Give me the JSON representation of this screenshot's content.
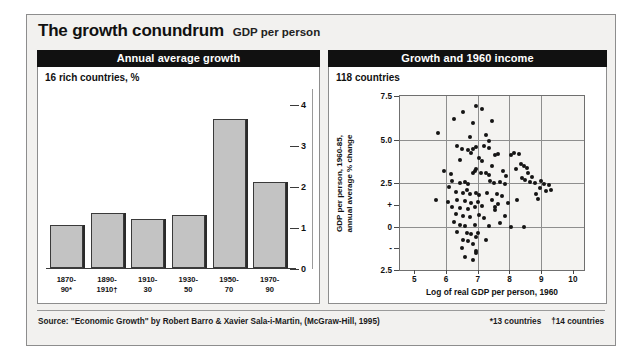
{
  "title": "The growth conundrum",
  "subtitle": "GDP per person",
  "panels": {
    "left": {
      "header": "Annual average growth",
      "note": "16 rich countries, %"
    },
    "right": {
      "header": "Growth and 1960 income",
      "note": "118 countries"
    }
  },
  "footer": {
    "source": "Source: \"Economic Growth\" by Robert Barro & Xavier Sala-i-Martin, (McGraw-Hill, 1995)",
    "footnote1": "*13 countries",
    "footnote2": "†14 countries"
  },
  "chart_data": [
    {
      "type": "bar",
      "title": "Annual average growth",
      "subtitle": "16 rich countries, %",
      "xlabel": "",
      "ylabel": "",
      "ylim": [
        0,
        4.3
      ],
      "yticks": [
        0,
        1,
        2,
        3,
        4
      ],
      "ytick_labels": [
        "0",
        "1",
        "2",
        "3",
        "4"
      ],
      "axis_position": "right",
      "grid": false,
      "categories": [
        "1870-90*",
        "1890-1910†",
        "1910-30",
        "1930-50",
        "1950-70",
        "1970-90"
      ],
      "category_lines": [
        [
          "1870-",
          "90*"
        ],
        [
          "1890-",
          "1910†"
        ],
        [
          "1910-",
          "30"
        ],
        [
          "1930-",
          "50"
        ],
        [
          "1950-",
          "70"
        ],
        [
          "1970-",
          "90"
        ]
      ],
      "values": [
        1.05,
        1.35,
        1.2,
        1.3,
        3.65,
        2.1
      ],
      "bar_color": "#c3c3c3",
      "bar_edge_color": "#3a3a3a"
    },
    {
      "type": "scatter",
      "title": "Growth and 1960 income",
      "subtitle": "118 countries",
      "xlabel": "Log of real GDP per person, 1960",
      "ylabel": "GDP per person, 1960-85, annual average % change",
      "ylabel_lines": [
        "GDP per person, 1960-85,",
        "annual average % change"
      ],
      "xlim": [
        4.55,
        10.35
      ],
      "ylim": [
        -2.5,
        7.5
      ],
      "xticks": [
        5,
        6,
        7,
        8,
        9,
        10
      ],
      "xtick_labels": [
        "5",
        "6",
        "7",
        "8",
        "9",
        "10"
      ],
      "yticks": [
        7.5,
        5.0,
        2.5,
        1.25,
        0,
        -1.25,
        -2.5
      ],
      "ytick_labels": [
        "7.5",
        "5.0",
        "2.5",
        "+",
        "0",
        "-",
        "2.5"
      ],
      "gridlines_y": [
        5.0,
        2.5,
        0
      ],
      "gridlines_x": [
        6,
        7,
        8,
        9
      ],
      "grid": true,
      "point_color": "#141414",
      "points": [
        [
          6.55,
          6.6
        ],
        [
          6.95,
          6.9
        ],
        [
          7.15,
          6.75
        ],
        [
          6.25,
          6.2
        ],
        [
          6.85,
          5.95
        ],
        [
          7.45,
          6.05
        ],
        [
          5.75,
          5.4
        ],
        [
          6.75,
          5.15
        ],
        [
          7.25,
          5.25
        ],
        [
          7.35,
          4.9
        ],
        [
          6.35,
          4.6
        ],
        [
          6.5,
          4.45
        ],
        [
          6.85,
          4.45
        ],
        [
          6.95,
          4.55
        ],
        [
          7.2,
          4.6
        ],
        [
          7.35,
          4.5
        ],
        [
          6.7,
          4.4
        ],
        [
          6.78,
          4.2
        ],
        [
          7.55,
          4.1
        ],
        [
          7.65,
          4.15
        ],
        [
          8.05,
          4.1
        ],
        [
          8.15,
          4.25
        ],
        [
          8.3,
          4.15
        ],
        [
          6.45,
          3.85
        ],
        [
          7.05,
          3.95
        ],
        [
          7.15,
          3.75
        ],
        [
          8.35,
          3.6
        ],
        [
          8.45,
          3.5
        ],
        [
          8.55,
          3.35
        ],
        [
          5.95,
          3.2
        ],
        [
          6.85,
          3.1
        ],
        [
          6.9,
          3.2
        ],
        [
          6.95,
          3.3
        ],
        [
          7.1,
          3.1
        ],
        [
          7.25,
          3.05
        ],
        [
          7.35,
          2.95
        ],
        [
          8.6,
          3.05
        ],
        [
          8.7,
          2.85
        ],
        [
          8.4,
          2.8
        ],
        [
          8.5,
          2.7
        ],
        [
          6.2,
          2.6
        ],
        [
          6.45,
          2.5
        ],
        [
          6.6,
          2.55
        ],
        [
          6.7,
          2.45
        ],
        [
          7.4,
          2.6
        ],
        [
          7.5,
          2.5
        ],
        [
          7.7,
          2.55
        ],
        [
          7.85,
          2.45
        ],
        [
          8.65,
          2.55
        ],
        [
          8.8,
          2.5
        ],
        [
          9.0,
          2.6
        ],
        [
          9.1,
          2.45
        ],
        [
          9.25,
          2.4
        ],
        [
          8.95,
          2.2
        ],
        [
          9.3,
          2.1
        ],
        [
          6.3,
          2.0
        ],
        [
          6.55,
          1.95
        ],
        [
          6.65,
          2.1
        ],
        [
          6.75,
          1.85
        ],
        [
          6.95,
          1.9
        ],
        [
          7.05,
          1.8
        ],
        [
          7.3,
          1.95
        ],
        [
          7.6,
          1.85
        ],
        [
          7.75,
          1.75
        ],
        [
          8.85,
          1.85
        ],
        [
          5.7,
          1.55
        ],
        [
          6.05,
          1.4
        ],
        [
          6.35,
          1.5
        ],
        [
          6.6,
          1.45
        ],
        [
          6.8,
          1.35
        ],
        [
          7.0,
          1.4
        ],
        [
          7.45,
          1.5
        ],
        [
          7.65,
          1.3
        ],
        [
          7.95,
          1.35
        ],
        [
          6.2,
          1.1
        ],
        [
          6.45,
          1.05
        ],
        [
          6.7,
          1.0
        ],
        [
          6.9,
          1.1
        ],
        [
          7.15,
          1.15
        ],
        [
          7.55,
          1.1
        ],
        [
          6.3,
          0.7
        ],
        [
          6.55,
          0.6
        ],
        [
          6.75,
          0.55
        ],
        [
          7.05,
          0.65
        ],
        [
          7.2,
          0.5
        ],
        [
          7.85,
          0.6
        ],
        [
          6.45,
          0.1
        ],
        [
          6.6,
          0.05
        ],
        [
          6.9,
          0.1
        ],
        [
          7.35,
          0.05
        ],
        [
          8.05,
          0.0
        ],
        [
          8.45,
          0.0
        ],
        [
          6.35,
          -0.3
        ],
        [
          6.65,
          -0.35
        ],
        [
          6.8,
          -0.45
        ],
        [
          7.0,
          -0.4
        ],
        [
          6.95,
          -0.6
        ],
        [
          6.55,
          -0.75
        ],
        [
          6.7,
          -0.85
        ],
        [
          7.25,
          -0.8
        ],
        [
          6.85,
          -1.0
        ],
        [
          6.5,
          -1.25
        ],
        [
          6.95,
          -1.4
        ],
        [
          6.95,
          -1.55
        ],
        [
          6.6,
          -1.75
        ],
        [
          6.85,
          -1.95
        ],
        [
          7.45,
          3.45
        ],
        [
          8.2,
          3.3
        ],
        [
          7.8,
          3.2
        ],
        [
          6.15,
          3.0
        ],
        [
          7.55,
          0.95
        ],
        [
          8.25,
          1.55
        ],
        [
          7.7,
          0.2
        ],
        [
          6.25,
          0.25
        ],
        [
          7.9,
          2.9
        ],
        [
          9.15,
          2.05
        ],
        [
          8.9,
          1.6
        ],
        [
          6.1,
          2.25
        ]
      ]
    }
  ]
}
